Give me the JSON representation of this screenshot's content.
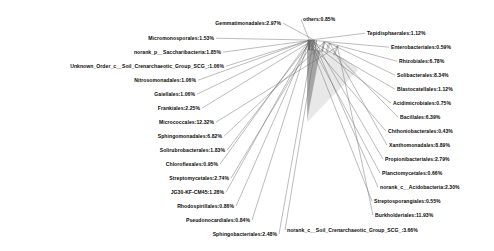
{
  "chart_data": {
    "type": "pie",
    "title": "",
    "legend_position": "outside-labels",
    "label_format": "name:percent",
    "categories": [
      "others",
      "Tepidisphaerales",
      "Enterobacteriales",
      "Rhizobiales",
      "Solibacterales",
      "Blastocatellales",
      "Acidimicrobiales",
      "Bacillales",
      "Chthoniobacterales",
      "Xanthomonadales",
      "Propionibacteriales",
      "Planctomycetales",
      "norank_c__Acidobacteria",
      "Streptosporangiales",
      "Burkholderiales",
      "norank_c__Soil_Crenarchaeotic_Group_SCG_",
      "Sphingobacteriales",
      "Pseudonocardiales",
      "Rhodospirillales",
      "JG30-KF-CM45",
      "Streptomycetales",
      "Chloroflexales",
      "Solirubrobacterales",
      "Sphingomonadales",
      "Micrococcales",
      "Frankiales",
      "Gaiellales",
      "Nitrosomonadales",
      "Unknown_Order_c__Soil_Crenarchaeotic_Group_SCG_",
      "norank_p__Saccharibacteria",
      "Micromonosporales",
      "Gemmatimonadales"
    ],
    "values": [
      0.85,
      1.12,
      0.59,
      6.78,
      8.34,
      1.12,
      0.75,
      6.39,
      0.43,
      8.89,
      2.79,
      0.66,
      2.3,
      0.55,
      11.93,
      3.66,
      2.48,
      0.84,
      0.86,
      1.28,
      2.74,
      0.95,
      1.83,
      6.82,
      12.32,
      2.25,
      1.06,
      1.06,
      1.06,
      1.85,
      1.53,
      2.97
    ],
    "labels": [
      "others:0.85%",
      "Tepidisphaerales:1.12%",
      "Enterobacteriales:0.59%",
      "Rhizobiales:6.78%",
      "Solibacterales:8.34%",
      "Blastocatellales:1.12%",
      "Acidimicrobiales:0.75%",
      "Bacillales:6.39%",
      "Chthoniobacterales:0.43%",
      "Xanthomonadales:8.89%",
      "Propionibacteriales:2.79%",
      "Planctomycetales:0.66%",
      "norank_c__Acidobacteria:2.30%",
      "Streptosporangiales:0.55%",
      "Burkholderiales:11.93%",
      "norank_c__Soil_Crenarchaeotic_Group_SCG_:3.66%",
      "Sphingobacteriales:2.48%",
      "Pseudonocardiales:0.84%",
      "Rhodospirillales:0.86%",
      "JG30-KF-CM45:1.28%",
      "Streptomycetales:2.74%",
      "Chloroflexales:0.95%",
      "Solirubrobacterales:1.83%",
      "Sphingomonadales:6.82%",
      "Micrococcales:12.32%",
      "Frankiales:2.25%",
      "Gaiellales:1.06%",
      "Nitrosomonadales:1.06%",
      "Unknown_Order_c__Soil_Crenarchaeotic_Group_SCG_:1.06%",
      "norank_p__Saccharibacteria:1.85%",
      "Micromonosporales:1.53%",
      "Gemmatimonadales:2.97%"
    ],
    "colors": [
      "#8f8f8f",
      "#d9d9d9",
      "#bdbdbd",
      "#6e6e6e",
      "#5a5a5a",
      "#c9c9c9",
      "#ededed",
      "#7d7d7d",
      "#a8a8a8",
      "#707070",
      "#d2d2d2",
      "#9b9b9b",
      "#b5b5b5",
      "#0a0a0a",
      "#636363",
      "#8a8a8a",
      "#c4c4c4",
      "#e4e4e4",
      "#9f9f9f",
      "#747474",
      "#b0b0b0",
      "#dcdcdc",
      "#8c8c8c",
      "#cfcfcf",
      "#e8e8e8",
      "#9a9a9a",
      "#666666",
      "#cccccc",
      "#3d3d3d",
      "#b8b8b8",
      "#7a7a7a",
      "#a5a5a5"
    ],
    "center": {
      "x": 307,
      "y": 122
    },
    "radius": 73,
    "start_angle_deg": -90
  }
}
